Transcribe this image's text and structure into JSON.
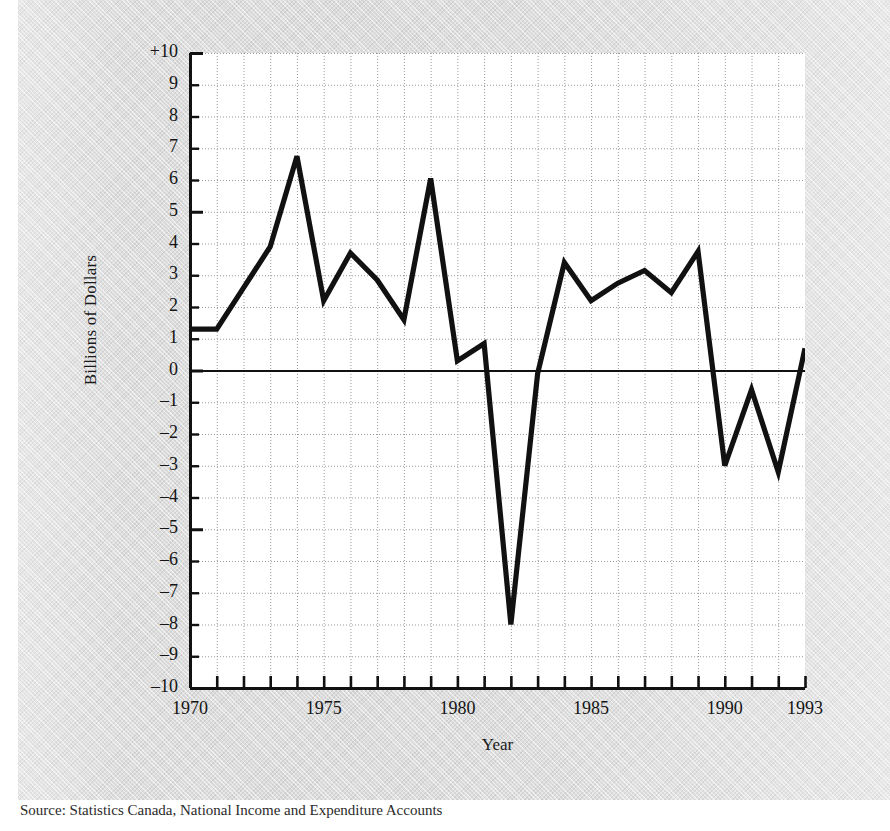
{
  "figure": {
    "xlabel": "Year",
    "ylabel": "Billions of Dollars",
    "source_caption": "Source: Statistics Canada, National Income and Expenditure Accounts"
  },
  "axis": {
    "y_tick_labels": [
      "+10",
      "9",
      "8",
      "7",
      "6",
      "5",
      "4",
      "3",
      "2",
      "1",
      "0",
      "–1",
      "–2",
      "–3",
      "–4",
      "–5",
      "–6",
      "–7",
      "–8",
      "–9",
      "–10"
    ],
    "x_tick_labels": [
      "1970",
      "1975",
      "1980",
      "1985",
      "1990",
      "1993"
    ]
  },
  "colors": {
    "line": "#111111",
    "axis": "#111111",
    "grid": "#9a9a9a",
    "plot_background": "#ffffff",
    "page_background": "#dcdcdc"
  },
  "chart_data": {
    "type": "line",
    "title": "",
    "xlabel": "Year",
    "ylabel": "Billions of Dollars",
    "xlim": [
      1970,
      1993
    ],
    "ylim": [
      -10,
      10
    ],
    "grid": true,
    "legend": "none",
    "x": [
      1970,
      1971,
      1972,
      1973,
      1974,
      1975,
      1976,
      1977,
      1978,
      1979,
      1980,
      1981,
      1982,
      1983,
      1984,
      1985,
      1986,
      1987,
      1988,
      1989,
      1990,
      1991,
      1992,
      1993
    ],
    "values": [
      1.3,
      1.3,
      2.6,
      3.9,
      6.75,
      2.2,
      3.7,
      2.85,
      1.6,
      6.05,
      0.3,
      0.85,
      -8.0,
      -0.1,
      3.4,
      2.2,
      2.75,
      3.15,
      2.45,
      3.75,
      -3.0,
      -0.6,
      -3.2,
      0.7
    ],
    "series": [
      {
        "name": "Balance",
        "values": [
          1.3,
          1.3,
          2.6,
          3.9,
          6.75,
          2.2,
          3.7,
          2.85,
          1.6,
          6.05,
          0.3,
          0.85,
          -8.0,
          -0.1,
          3.4,
          2.2,
          2.75,
          3.15,
          2.45,
          3.75,
          -3.0,
          -0.6,
          -3.2,
          0.7
        ]
      }
    ],
    "y_major_ticks": [
      -10,
      -9,
      -8,
      -7,
      -6,
      -5,
      -4,
      -3,
      -2,
      -1,
      0,
      1,
      2,
      3,
      4,
      5,
      6,
      7,
      8,
      9,
      10
    ],
    "x_major_ticks": [
      1970,
      1975,
      1980,
      1985,
      1990,
      1993
    ],
    "zero_line": 0
  }
}
